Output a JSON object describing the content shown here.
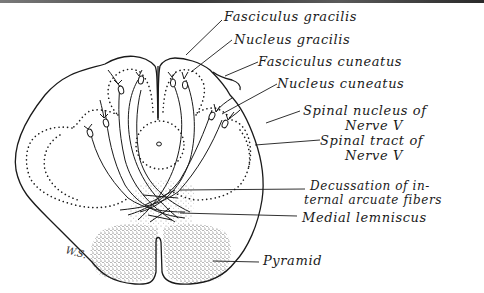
{
  "figure": {
    "signature": "W.S.",
    "labels": {
      "fasciculus_gracilis": "Fasciculus gracilis",
      "nucleus_gracilis": "Nucleus gracilis",
      "fasciculus_cuneatus": "Fasciculus cuneatus",
      "nucleus_cuneatus": "Nucleus cuneatus",
      "spinal_nucleus_line1": "Spinal nucleus of",
      "spinal_nucleus_line2": "Nerve V",
      "spinal_tract_line1": "Spinal tract of",
      "spinal_tract_line2": "Nerve V",
      "decussation_line1": "Decussation of in-",
      "decussation_line2": "ternal arcuate fibers",
      "medial_lemniscus": "Medial lemniscus",
      "pyramid": "Pyramid"
    }
  }
}
